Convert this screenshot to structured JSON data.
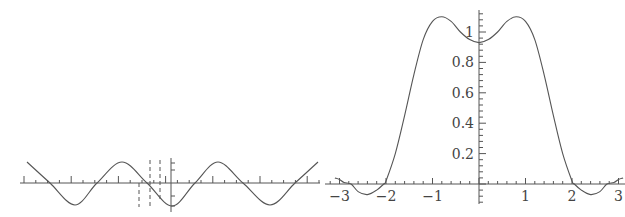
{
  "chart_data": [
    {
      "type": "line",
      "title": "",
      "xlabel": "",
      "ylabel": "",
      "description": "Left panel: sinusoid with vertical dashed markers near the origin; unlabeled ticks",
      "series": [
        {
          "name": "sinusoid",
          "x_px": [
            27,
            50,
            75,
            97,
            122,
            147,
            172,
            195,
            218,
            243,
            270,
            295,
            318
          ],
          "y_px": [
            162,
            183,
            205,
            183,
            162,
            183,
            206,
            183,
            162,
            183,
            205,
            183,
            162
          ]
        }
      ],
      "dashed_markers_px": [
        {
          "x": 139,
          "y1": 183,
          "y2": 207
        },
        {
          "x": 150,
          "y1": 160,
          "y2": 207
        },
        {
          "x": 160,
          "y1": 160,
          "y2": 200
        }
      ],
      "grid": false
    },
    {
      "type": "line",
      "title": "",
      "xlabel": "",
      "ylabel": "",
      "x_ticks": [
        "-3",
        "-2",
        "-1",
        "1",
        "2",
        "3"
      ],
      "y_ticks": [
        "0.2",
        "0.4",
        "0.6",
        "0.8",
        "1"
      ],
      "xlim": [
        -3.15,
        3.15
      ],
      "ylim": [
        -0.1,
        1.15
      ],
      "grid": false,
      "series": [
        {
          "name": "f(x)",
          "x": [
            -3.1,
            -3.0,
            -2.9,
            -2.75,
            -2.6,
            -2.4,
            -2.2,
            -2.05,
            -2.0,
            -1.8,
            -1.6,
            -1.4,
            -1.2,
            -1.0,
            -0.8,
            -0.6,
            -0.4,
            -0.2,
            0,
            0.2,
            0.4,
            0.6,
            0.8,
            1.0,
            1.2,
            1.4,
            1.6,
            1.8,
            2.0,
            2.05,
            2.2,
            2.4,
            2.6,
            2.75,
            2.9,
            3.0,
            3.1
          ],
          "values": [
            0.04,
            0.03,
            0.01,
            0,
            -0.05,
            -0.07,
            -0.04,
            0,
            0.02,
            0.2,
            0.45,
            0.72,
            0.95,
            1.07,
            1.1,
            1.07,
            1.0,
            0.95,
            0.93,
            0.95,
            1.0,
            1.07,
            1.1,
            1.07,
            0.95,
            0.72,
            0.45,
            0.2,
            0.02,
            0,
            -0.04,
            -0.07,
            -0.05,
            0,
            0.01,
            0.03,
            0.04
          ]
        }
      ]
    }
  ],
  "labels": {
    "x": [
      "-3",
      "-2",
      "-1",
      "1",
      "2",
      "3"
    ],
    "y": [
      "0.2",
      "0.4",
      "0.6",
      "0.8",
      "1"
    ]
  }
}
